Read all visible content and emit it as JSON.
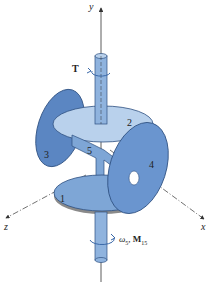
{
  "figure": {
    "type": "mechanism-diagram",
    "colors": {
      "disk_light": "#b9d1ec",
      "disk_mid": "#7ea6d6",
      "disk_dark": "#4d79b8",
      "shaft": "#8fb3de",
      "outline": "#2d4f80",
      "axis": "#333333",
      "rim": "#8a8a8a"
    },
    "axes": {
      "x_label": "x",
      "y_label": "y",
      "z_label": "z"
    },
    "parts": [
      {
        "id": "1",
        "label": "1"
      },
      {
        "id": "2",
        "label": "2"
      },
      {
        "id": "3",
        "label": "3"
      },
      {
        "id": "4",
        "label": "4"
      },
      {
        "id": "5",
        "label": "5"
      }
    ],
    "annotations": {
      "torque_top": "T",
      "bottom_omega": "ω",
      "bottom_omega_sub": "5",
      "bottom_sep": ", ",
      "bottom_moment": "M",
      "bottom_moment_sub": "15"
    }
  }
}
